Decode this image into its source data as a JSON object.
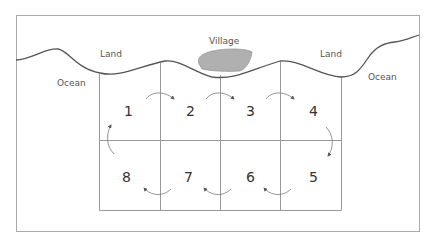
{
  "labels": {
    "village": "Village",
    "land_left": "Land",
    "land_right": "Land",
    "ocean_left": "Ocean",
    "ocean_right": "Ocean"
  },
  "cells": [
    {
      "id": "1",
      "label": "1"
    },
    {
      "id": "2",
      "label": "2"
    },
    {
      "id": "3",
      "label": "3"
    },
    {
      "id": "4",
      "label": "4"
    },
    {
      "id": "5",
      "label": "5"
    },
    {
      "id": "6",
      "label": "6"
    },
    {
      "id": "7",
      "label": "7"
    },
    {
      "id": "8",
      "label": "8"
    }
  ],
  "colors": {
    "coastline": "#555555",
    "grid": "#999999",
    "village_fill": "#b0b0b0",
    "arrow": "#777777",
    "frame": "#aaaaaa"
  }
}
